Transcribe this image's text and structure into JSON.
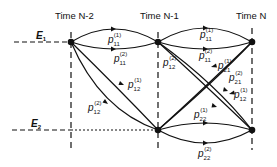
{
  "diagram": {
    "time_labels": [
      "Time N-2",
      "Time N-1",
      "Time N"
    ],
    "state_labels": {
      "E1": {
        "base": "E",
        "sub": "1"
      },
      "E2": {
        "base": "E",
        "sub": "2"
      }
    },
    "transitions": [
      {
        "id": "p11_1_a",
        "base": "p",
        "sub": "11",
        "sup": "(1)"
      },
      {
        "id": "p11_2_a",
        "base": "p",
        "sub": "11",
        "sup": "(2)"
      },
      {
        "id": "p12_1_a",
        "base": "p",
        "sub": "12",
        "sup": "(1)"
      },
      {
        "id": "p12_2_a",
        "base": "p",
        "sub": "12",
        "sup": "(2)"
      },
      {
        "id": "p11_1_b",
        "base": "p",
        "sub": "11",
        "sup": "(1)"
      },
      {
        "id": "p11_2_b",
        "base": "p",
        "sub": "11",
        "sup": "(2)"
      },
      {
        "id": "p12_2_b",
        "base": "p",
        "sub": "12",
        "sup": "(2)"
      },
      {
        "id": "p21_1_b",
        "base": "p",
        "sub": "21",
        "sup": "(1)"
      },
      {
        "id": "p21_2_b",
        "base": "p",
        "sub": "21",
        "sup": "(2)"
      },
      {
        "id": "p12_1_b",
        "base": "p",
        "sub": "12",
        "sup": "(1)"
      },
      {
        "id": "p22_1_b",
        "base": "p",
        "sub": "22",
        "sup": "(1)"
      },
      {
        "id": "p22_2_b",
        "base": "p",
        "sub": "22",
        "sup": "(2)"
      }
    ]
  }
}
